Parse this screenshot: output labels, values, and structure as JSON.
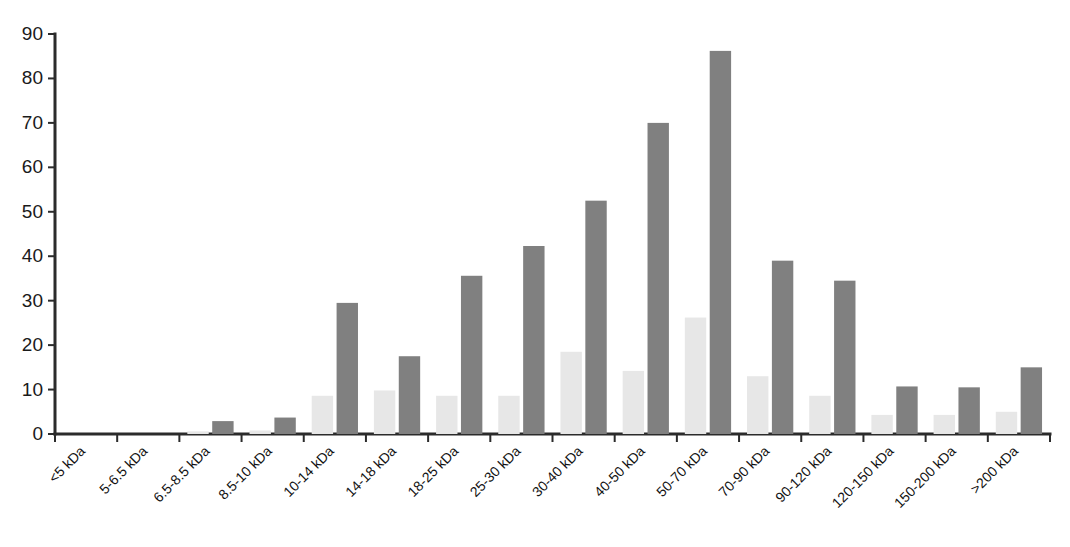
{
  "chart_data": {
    "type": "bar",
    "title": "",
    "subtitle": "",
    "xlabel": "",
    "ylabel": "",
    "ylim": [
      0,
      90
    ],
    "yticks": [
      0,
      10,
      20,
      30,
      40,
      50,
      60,
      70,
      80,
      90
    ],
    "grid": false,
    "legend": "none",
    "orientation": "vertical",
    "grouping": "grouped",
    "categories": [
      "<5 kDa",
      "5-6.5 kDa",
      "6.5-8.5 kDa",
      "8.5-10 kDa",
      "10-14 kDa",
      "14-18 kDa",
      "18-25 kDa",
      "25-30 kDa",
      "30-40 kDa",
      "40-50 kDa",
      "50-70 kDa",
      "70-90 kDa",
      "90-120 kDa",
      "120-150 kDa",
      "150-200 kDa",
      ">200 kDa"
    ],
    "series": [
      {
        "name": "series-light",
        "color": "#e7e7e7",
        "values": [
          0,
          0,
          0.6,
          0.8,
          8.6,
          9.8,
          8.6,
          8.6,
          18.5,
          14.2,
          26.2,
          13.0,
          8.6,
          4.3,
          4.3,
          5.0
        ]
      },
      {
        "name": "series-dark",
        "color": "#808080",
        "values": [
          0,
          0,
          2.9,
          3.7,
          29.5,
          17.5,
          35.6,
          42.3,
          52.5,
          70.0,
          86.2,
          39.0,
          34.5,
          10.7,
          10.5,
          15.0
        ]
      }
    ]
  },
  "axis": {
    "y_tick_labels": [
      "0",
      "10",
      "20",
      "30",
      "40",
      "50",
      "60",
      "70",
      "80",
      "90"
    ],
    "x_tick_labels": [
      "<5 kDa",
      "5-6.5 kDa",
      "6.5-8.5 kDa",
      "8.5-10 kDa",
      "10-14 kDa",
      "14-18 kDa",
      "18-25 kDa",
      "25-30 kDa",
      "30-40 kDa",
      "40-50 kDa",
      "50-70 kDa",
      "70-90 kDa",
      "90-120 kDa",
      "120-150 kDa",
      "150-200 kDa",
      ">200 kDa"
    ]
  },
  "colors": {
    "light_series": "#e7e7e7",
    "dark_series": "#808080",
    "axis": "#2b2b2b",
    "text": "#121212",
    "background": "#ffffff"
  },
  "footer": {
    "mark": ""
  }
}
